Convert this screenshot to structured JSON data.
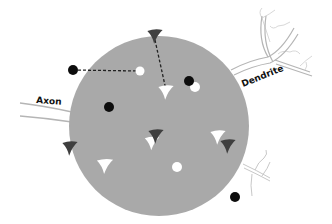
{
  "diagram": {
    "type": "neuron-schematic",
    "labels": {
      "axon": "Axon",
      "dendrite": "Dendrite"
    },
    "colors": {
      "soma": "#a9a9a9",
      "dark_marker": "#3f3f3f",
      "black_dot": "#0d0d0d",
      "white_marker": "#ffffff",
      "process_line": "#b5b5b5",
      "faint_branch": "#d8d8d8"
    },
    "soma": {
      "shape": "circle",
      "cx": 159,
      "cy": 126,
      "r": 90
    },
    "black_dots": [
      {
        "x": 73,
        "y": 70,
        "location": "outside"
      },
      {
        "x": 109,
        "y": 107,
        "location": "inside"
      },
      {
        "x": 189,
        "y": 81,
        "location": "inside"
      },
      {
        "x": 235,
        "y": 197,
        "location": "outside"
      }
    ],
    "white_dots": [
      {
        "x": 140,
        "y": 71
      },
      {
        "x": 195,
        "y": 87
      },
      {
        "x": 177,
        "y": 167
      }
    ],
    "dark_arrowheads": [
      {
        "x": 155,
        "y": 36
      },
      {
        "x": 70,
        "y": 148
      },
      {
        "x": 156,
        "y": 136
      },
      {
        "x": 228,
        "y": 146
      }
    ],
    "white_arrowheads": [
      {
        "x": 166,
        "y": 92
      },
      {
        "x": 152,
        "y": 143
      },
      {
        "x": 218,
        "y": 137
      },
      {
        "x": 105,
        "y": 166
      }
    ],
    "dashed_links": [
      {
        "from": [
          73,
          70
        ],
        "to": [
          140,
          71
        ]
      },
      {
        "from": [
          155,
          40
        ],
        "to": [
          166,
          90
        ]
      }
    ]
  }
}
